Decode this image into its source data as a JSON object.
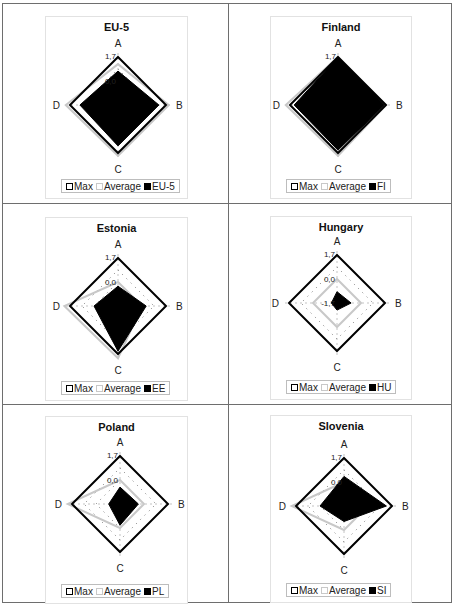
{
  "layout": {
    "columns": 2,
    "rows": 3
  },
  "legend_labels": {
    "max": "Max",
    "average": "Average"
  },
  "axes": [
    "A",
    "B",
    "C",
    "D"
  ],
  "tick_labels": {
    "outer": "1,7",
    "mid": "0,0",
    "inner": "-1,7"
  },
  "colors": {
    "series": "#000000",
    "max": "#000000",
    "average": "#c8c8c8",
    "grid": "#555555"
  },
  "panels": [
    {
      "title": "EU-5",
      "series_label": "EU-5",
      "show_mid_tick": true,
      "show_inner_tick": false
    },
    {
      "title": "Finland",
      "series_label": "FI",
      "show_mid_tick": false,
      "show_inner_tick": false
    },
    {
      "title": "Estonia",
      "series_label": "EE",
      "show_mid_tick": true,
      "show_inner_tick": false
    },
    {
      "title": "Hungary",
      "series_label": "HU",
      "show_mid_tick": true,
      "show_inner_tick": true
    },
    {
      "title": "Poland",
      "series_label": "PL",
      "show_mid_tick": true,
      "show_inner_tick": false
    },
    {
      "title": "Slovenia",
      "series_label": "SI",
      "show_mid_tick": true,
      "show_inner_tick": false
    }
  ],
  "chart_data": [
    {
      "type": "radar",
      "title": "EU-5",
      "categories": [
        "A",
        "B",
        "C",
        "D"
      ],
      "scale": [
        -1.7,
        1.7
      ],
      "series": [
        {
          "name": "Max",
          "values": [
            1.7,
            1.7,
            1.7,
            1.7
          ]
        },
        {
          "name": "Average",
          "values": [
            1.2,
            1.9,
            1.9,
            2.0
          ]
        },
        {
          "name": "EU-5",
          "values": [
            0.7,
            1.2,
            1.2,
            1.0
          ]
        }
      ]
    },
    {
      "type": "radar",
      "title": "Finland",
      "categories": [
        "A",
        "B",
        "C",
        "D"
      ],
      "scale": [
        -1.7,
        1.7
      ],
      "series": [
        {
          "name": "Max",
          "values": [
            1.7,
            1.7,
            1.7,
            1.7
          ]
        },
        {
          "name": "Average",
          "values": [
            1.7,
            1.7,
            1.9,
            2.0
          ]
        },
        {
          "name": "FI",
          "values": [
            1.7,
            1.6,
            1.5,
            1.4
          ]
        }
      ]
    },
    {
      "type": "radar",
      "title": "Estonia",
      "categories": [
        "A",
        "B",
        "C",
        "D"
      ],
      "scale": [
        -1.7,
        1.7
      ],
      "series": [
        {
          "name": "Max",
          "values": [
            1.7,
            1.7,
            1.7,
            1.7
          ]
        },
        {
          "name": "Average",
          "values": [
            0.0,
            0.0,
            2.0,
            2.1
          ]
        },
        {
          "name": "EE",
          "values": [
            -0.3,
            0.3,
            1.5,
            0.0
          ]
        }
      ]
    },
    {
      "type": "radar",
      "title": "Hungary",
      "categories": [
        "A",
        "B",
        "C",
        "D"
      ],
      "scale": [
        -1.7,
        1.7
      ],
      "series": [
        {
          "name": "Max",
          "values": [
            1.7,
            1.7,
            1.7,
            1.7
          ]
        },
        {
          "name": "Average",
          "values": [
            0.0,
            0.0,
            0.0,
            0.0
          ]
        },
        {
          "name": "HU",
          "values": [
            -0.9,
            -0.7,
            -1.2,
            -1.3
          ]
        }
      ]
    },
    {
      "type": "radar",
      "title": "Poland",
      "categories": [
        "A",
        "B",
        "C",
        "D"
      ],
      "scale": [
        -1.7,
        1.7
      ],
      "series": [
        {
          "name": "Max",
          "values": [
            1.7,
            1.7,
            1.7,
            1.7
          ]
        },
        {
          "name": "Average",
          "values": [
            0.0,
            0.0,
            0.0,
            2.0
          ]
        },
        {
          "name": "PL",
          "values": [
            -0.5,
            -0.4,
            -0.2,
            -0.9
          ]
        }
      ]
    },
    {
      "type": "radar",
      "title": "Slovenia",
      "categories": [
        "A",
        "B",
        "C",
        "D"
      ],
      "scale": [
        -1.7,
        1.7
      ],
      "series": [
        {
          "name": "Max",
          "values": [
            1.7,
            1.7,
            1.7,
            1.7
          ]
        },
        {
          "name": "Average",
          "values": [
            0.0,
            0.0,
            0.0,
            2.0
          ]
        },
        {
          "name": "SI",
          "values": [
            0.4,
            1.3,
            -0.6,
            0.0
          ]
        }
      ]
    }
  ]
}
